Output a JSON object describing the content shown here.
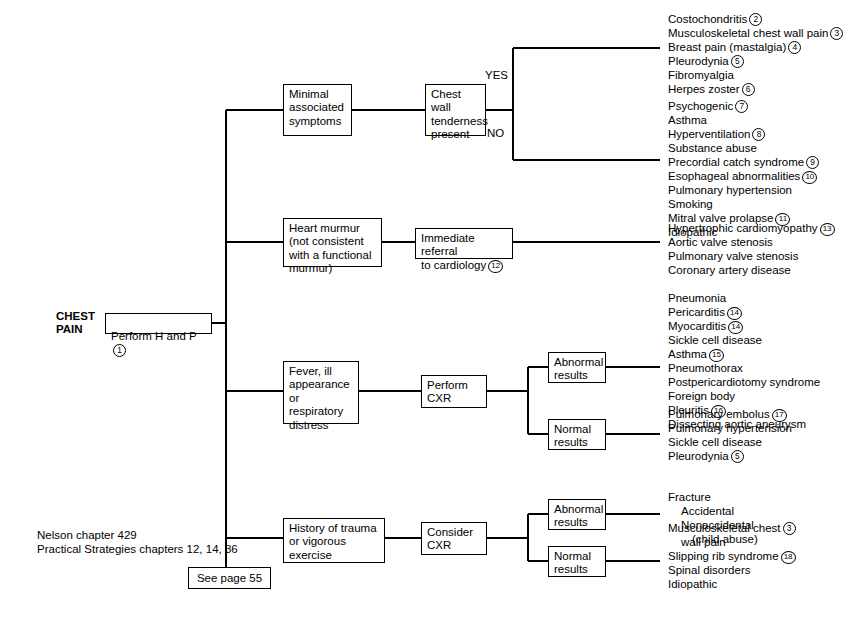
{
  "root": {
    "label": "CHEST\nPAIN",
    "first_step": "Perform H and P",
    "first_step_ref": "1"
  },
  "branches": [
    {
      "id": "minimal-symptoms",
      "label": "Minimal\nassociated\nsymptoms",
      "decision": "Chest wall\ntenderness\npresent",
      "yes_label": "YES",
      "no_label": "NO"
    },
    {
      "id": "heart-murmur",
      "label": "Heart murmur\n(not consistent\nwith a functional\nmurmur)",
      "action": "Immediate referral\nto cardiology",
      "action_ref": "12"
    },
    {
      "id": "fever-respiratory",
      "label": "Fever, ill\nappearance\nor respiratory\ndistress",
      "action": "Perform\nCXR",
      "abnormal_label": "Abnormal\nresults",
      "normal_label": "Normal\nresults"
    },
    {
      "id": "trauma-exercise",
      "label": "History of trauma\nor vigorous\nexercise",
      "action": "Consider\nCXR",
      "abnormal_label": "Abnormal\nresults",
      "normal_label": "Normal\nresults"
    }
  ],
  "outcomes": {
    "tenderness_yes": [
      {
        "text": "Costochondritis",
        "ref": "2"
      },
      {
        "text": "Musculoskeletal chest wall pain",
        "ref": "3"
      },
      {
        "text": "Breast pain (mastalgia)",
        "ref": "4"
      },
      {
        "text": "Pleurodynia",
        "ref": "5"
      },
      {
        "text": "Fibromyalgia",
        "ref": ""
      },
      {
        "text": "Herpes zoster",
        "ref": "6"
      }
    ],
    "tenderness_no": [
      {
        "text": "Psychogenic",
        "ref": "7"
      },
      {
        "text": "Asthma",
        "ref": ""
      },
      {
        "text": "Hyperventilation",
        "ref": "8"
      },
      {
        "text": "Substance abuse",
        "ref": ""
      },
      {
        "text": "Precordial catch syndrome",
        "ref": "9"
      },
      {
        "text": "Esophageal abnormalities",
        "ref": "10"
      },
      {
        "text": "Pulmonary hypertension",
        "ref": ""
      },
      {
        "text": "Smoking",
        "ref": ""
      },
      {
        "text": "Mitral valve prolapse",
        "ref": "11"
      },
      {
        "text": "Idiopathic",
        "ref": ""
      }
    ],
    "cardiology": [
      {
        "text": "Hypertrophic cardiomyopathy",
        "ref": "13"
      },
      {
        "text": "Aortic valve stenosis",
        "ref": ""
      },
      {
        "text": "Pulmonary valve stenosis",
        "ref": ""
      },
      {
        "text": "Coronary artery disease",
        "ref": ""
      }
    ],
    "cxr_abnormal": [
      {
        "text": "Pneumonia",
        "ref": ""
      },
      {
        "text": "Pericarditis",
        "ref": "14"
      },
      {
        "text": "Myocarditis",
        "ref": "14"
      },
      {
        "text": "Sickle cell disease",
        "ref": ""
      },
      {
        "text": "Asthma",
        "ref": "15"
      },
      {
        "text": "Pneumothorax",
        "ref": ""
      },
      {
        "text": "Postpericardiotomy syndrome",
        "ref": ""
      },
      {
        "text": "Foreign body",
        "ref": ""
      },
      {
        "text": "Pleuritis",
        "ref": "16"
      },
      {
        "text": "Dissecting aortic aneurysm",
        "ref": ""
      }
    ],
    "cxr_normal": [
      {
        "text": "Pulmonary embolus",
        "ref": "17"
      },
      {
        "text": "Pulmonary hypertension",
        "ref": ""
      },
      {
        "text": "Sickle cell disease",
        "ref": ""
      },
      {
        "text": "Pleurodynia",
        "ref": "5"
      }
    ],
    "trauma_abnormal": [
      {
        "text": "Fracture",
        "ref": "",
        "indent": 0
      },
      {
        "text": "Accidental",
        "ref": "",
        "indent": 1
      },
      {
        "text": "Nonaccidental",
        "ref": "",
        "indent": 1
      },
      {
        "text": "(child abuse)",
        "ref": "",
        "indent": 2
      }
    ],
    "trauma_normal": [
      {
        "text": "Musculoskeletal chest",
        "ref": "3",
        "indent": 0
      },
      {
        "text": "wall pain",
        "ref": "",
        "indent": 1
      },
      {
        "text": "Slipping rib syndrome",
        "ref": "18",
        "indent": 0
      },
      {
        "text": "Spinal disorders",
        "ref": "",
        "indent": 0
      },
      {
        "text": "Idiopathic",
        "ref": "",
        "indent": 0
      }
    ]
  },
  "footnote": "Nelson chapter 429\nPractical Strategies chapters 12, 14, 36",
  "page_ref": "See page 55",
  "colors": {
    "line": "#000000",
    "background": "#ffffff",
    "text": "#000000"
  }
}
